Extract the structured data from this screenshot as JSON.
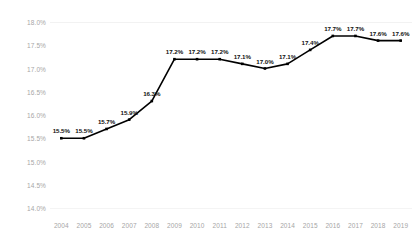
{
  "chart_data": {
    "type": "line",
    "title": "",
    "subtitle": "",
    "xlabel": "",
    "ylabel": "",
    "categories": [
      "2004",
      "2005",
      "2006",
      "2007",
      "2008",
      "2009",
      "2010",
      "2011",
      "2012",
      "2013",
      "2014",
      "2015",
      "2016",
      "2017",
      "2018",
      "2019"
    ],
    "values": [
      15.5,
      15.5,
      15.7,
      15.9,
      16.3,
      17.2,
      17.2,
      17.2,
      17.1,
      17.0,
      17.1,
      17.4,
      17.7,
      17.7,
      17.6,
      17.6
    ],
    "data_labels": [
      "15.5%",
      "15.5%",
      "15.7%",
      "15.9%",
      "16.3%",
      "17.2%",
      "17.2%",
      "17.2%",
      "17.1%",
      "17.0%",
      "17.1%",
      "17.4%",
      "17.7%",
      "17.7%",
      "17.6%",
      "17.6%"
    ],
    "ylim": [
      14.0,
      18.0
    ],
    "ytick_values": [
      18.0,
      17.5,
      17.0,
      16.5,
      16.0,
      15.5,
      15.0,
      14.5,
      14.0
    ],
    "ytick_labels": [
      "18.0%",
      "17.5%",
      "17.0%",
      "16.5%",
      "16.0%",
      "15.5%",
      "15.0%",
      "14.5%",
      "14.0%"
    ],
    "grid": false,
    "legend": "none",
    "series_color": "#000000",
    "marker": "square",
    "axis_text_color": "#a6a6a6",
    "label_text_color": "#111111"
  }
}
